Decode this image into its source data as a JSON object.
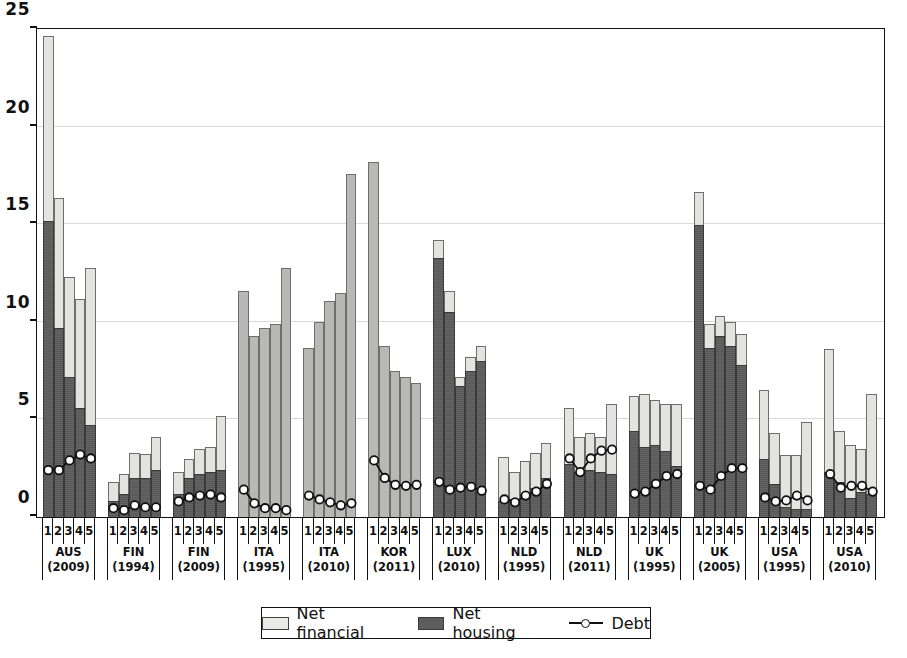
{
  "chart_data": {
    "type": "bar",
    "title": "",
    "subtitle": "",
    "xlabel": "",
    "ylabel": "",
    "ylim": [
      0,
      25
    ],
    "yticks": [
      0,
      5,
      10,
      15,
      20,
      25
    ],
    "grid": true,
    "stacked": true,
    "legend_position": "bottom",
    "legend": [
      {
        "label": "Net financial",
        "type": "bar-segment",
        "color": "#e3e3e1"
      },
      {
        "label": "Net housing",
        "type": "bar-segment",
        "color": "#5d5d5d"
      },
      {
        "label": "Debt",
        "type": "line-marker",
        "color": "#111111"
      }
    ],
    "quintile_labels": [
      "1",
      "2",
      "3",
      "4",
      "5"
    ],
    "groups": [
      {
        "country": "AUS",
        "year": "(2009)",
        "style": "two-tone",
        "net_housing": [
          15.2,
          9.7,
          7.2,
          5.6,
          4.7
        ],
        "total": [
          24.7,
          16.4,
          12.3,
          11.2,
          12.8
        ],
        "debt": [
          2.4,
          2.4,
          2.9,
          3.2,
          3.0
        ]
      },
      {
        "country": "FIN",
        "year": "(1994)",
        "style": "two-tone",
        "net_housing": [
          0.8,
          1.2,
          2.0,
          2.0,
          2.4
        ],
        "total": [
          1.8,
          2.2,
          3.3,
          3.25,
          4.1
        ],
        "debt": [
          0.45,
          0.35,
          0.6,
          0.5,
          0.5
        ]
      },
      {
        "country": "FIN",
        "year": "(2009)",
        "style": "two-tone",
        "net_housing": [
          1.2,
          2.0,
          2.2,
          2.3,
          2.4
        ],
        "total": [
          2.3,
          3.0,
          3.5,
          3.6,
          5.2
        ],
        "debt": [
          0.8,
          1.0,
          1.1,
          1.15,
          1.0
        ]
      },
      {
        "country": "ITA",
        "year": "(1995)",
        "style": "flat-gray",
        "net_housing": [
          0,
          0,
          0,
          0,
          0
        ],
        "total": [
          11.6,
          9.3,
          9.7,
          9.9,
          12.8
        ],
        "debt": [
          1.4,
          0.7,
          0.45,
          0.45,
          0.35
        ]
      },
      {
        "country": "ITA",
        "year": "(2010)",
        "style": "flat-gray",
        "net_housing": [
          0,
          0,
          0,
          0,
          0
        ],
        "total": [
          8.7,
          10.0,
          11.1,
          11.5,
          17.6
        ],
        "debt": [
          1.1,
          0.9,
          0.75,
          0.6,
          0.7
        ]
      },
      {
        "country": "KOR",
        "year": "(2011)",
        "style": "flat-gray",
        "net_housing": [
          0,
          0,
          0,
          0,
          0
        ],
        "total": [
          18.2,
          8.8,
          7.5,
          7.2,
          6.9
        ],
        "debt": [
          2.9,
          2.0,
          1.65,
          1.6,
          1.65
        ]
      },
      {
        "country": "LUX",
        "year": "(2010)",
        "style": "two-tone",
        "net_housing": [
          13.3,
          10.5,
          6.7,
          7.5,
          8.0
        ],
        "total": [
          14.2,
          11.6,
          7.2,
          8.2,
          8.8
        ],
        "debt": [
          1.8,
          1.4,
          1.5,
          1.55,
          1.35
        ]
      },
      {
        "country": "NLD",
        "year": "(1995)",
        "style": "two-tone",
        "net_housing": [
          0.8,
          0.9,
          1.2,
          1.5,
          2.0
        ],
        "total": [
          3.1,
          2.3,
          2.9,
          3.3,
          3.8
        ],
        "debt": [
          0.9,
          0.75,
          1.1,
          1.3,
          1.7
        ]
      },
      {
        "country": "NLD",
        "year": "(2011)",
        "style": "two-tone",
        "net_housing": [
          2.7,
          2.3,
          2.4,
          2.3,
          2.2
        ],
        "total": [
          5.6,
          4.1,
          4.3,
          4.1,
          5.8
        ],
        "debt": [
          3.0,
          2.3,
          3.0,
          3.4,
          3.45
        ]
      },
      {
        "country": "UK",
        "year": "(1995)",
        "style": "two-tone",
        "net_housing": [
          4.4,
          3.6,
          3.7,
          3.4,
          2.6
        ],
        "total": [
          6.2,
          6.3,
          6.0,
          5.8,
          5.8
        ],
        "debt": [
          1.2,
          1.3,
          1.7,
          2.1,
          2.2
        ]
      },
      {
        "country": "UK",
        "year": "(2005)",
        "style": "two-tone",
        "net_housing": [
          15.0,
          8.7,
          9.3,
          8.8,
          7.8
        ],
        "total": [
          16.7,
          9.9,
          10.3,
          10.0,
          9.4
        ],
        "debt": [
          1.6,
          1.4,
          2.1,
          2.5,
          2.5
        ]
      },
      {
        "country": "USA",
        "year": "(1995)",
        "style": "two-tone",
        "net_housing": [
          3.0,
          1.7,
          0.5,
          0.4,
          0.4
        ],
        "total": [
          6.5,
          4.3,
          3.2,
          3.2,
          4.9
        ],
        "debt": [
          1.0,
          0.8,
          0.85,
          1.1,
          0.85
        ]
      },
      {
        "country": "USA",
        "year": "(2010)",
        "style": "two-tone",
        "net_housing": [
          2.3,
          1.8,
          1.0,
          1.3,
          1.2
        ],
        "total": [
          8.6,
          4.4,
          3.7,
          3.5,
          6.3
        ],
        "debt": [
          2.2,
          1.5,
          1.6,
          1.6,
          1.3
        ]
      }
    ]
  }
}
